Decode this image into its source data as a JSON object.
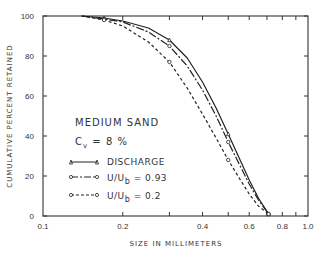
{
  "chart_data": {
    "type": "line",
    "title": "",
    "xlabel": "SIZE IN MILLIMETERS",
    "ylabel": "CUMULATIVE PERCENT RETAINED",
    "xscale": "log",
    "xlim": [
      0.1,
      1.0
    ],
    "ylim": [
      0,
      100
    ],
    "x_ticks": [
      "0.1",
      "0.2",
      "0.4",
      "0.6",
      "0.8",
      "1.0"
    ],
    "y_ticks": [
      "0",
      "20",
      "40",
      "60",
      "80",
      "100"
    ],
    "grid": false,
    "annotations": [
      "MEDIUM SAND",
      "Cv = 8 %"
    ],
    "legend_position": "lower-left inside",
    "series": [
      {
        "name": "DISCHARGE",
        "style": "solid",
        "marker": "triangle",
        "x": [
          0.14,
          0.17,
          0.2,
          0.25,
          0.3,
          0.35,
          0.4,
          0.45,
          0.5,
          0.55,
          0.6,
          0.65,
          0.71
        ],
        "y": [
          100,
          99,
          97.5,
          94,
          88,
          79,
          67,
          54,
          41,
          29,
          18,
          9,
          1
        ]
      },
      {
        "name": "U/Ub = 0.93",
        "style": "dash-dot",
        "marker": "circle",
        "x": [
          0.14,
          0.17,
          0.2,
          0.25,
          0.3,
          0.35,
          0.4,
          0.45,
          0.5,
          0.55,
          0.6,
          0.65,
          0.71
        ],
        "y": [
          100,
          98.5,
          97,
          92,
          85,
          75,
          63,
          50,
          37,
          26,
          16,
          8,
          1
        ]
      },
      {
        "name": "U/Ub = 0.2",
        "style": "dashed",
        "marker": "circle",
        "x": [
          0.14,
          0.17,
          0.2,
          0.25,
          0.3,
          0.35,
          0.4,
          0.45,
          0.5,
          0.55,
          0.6,
          0.65,
          0.71
        ],
        "y": [
          100,
          98,
          95,
          87,
          77,
          64,
          51,
          39,
          28,
          19,
          11,
          5,
          1
        ]
      }
    ]
  },
  "labels": {
    "ylabel": "CUMULATIVE PERCENT RETAINED",
    "xlabel": "SIZE IN MILLIMETERS",
    "material": "MEDIUM SAND",
    "cv_prefix": "C",
    "cv_sub": "v",
    "cv_value": " = 8 %",
    "legend": [
      {
        "text": "DISCHARGE"
      },
      {
        "text": "U/U",
        "sub": "b",
        "tail": " = 0.93"
      },
      {
        "text": "U/U",
        "sub": "b",
        "tail": " = 0.2"
      }
    ]
  }
}
